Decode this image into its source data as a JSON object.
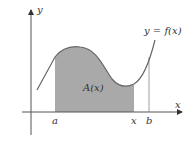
{
  "diagram": {
    "axes": {
      "x_label": "x",
      "y_label": "y"
    },
    "curve_label": "y = f(x)",
    "area_label": "A(x)",
    "ticks": {
      "a": "a",
      "x": "x",
      "b": "b"
    },
    "colors": {
      "area": "#a9a9a9",
      "curve": "#666666",
      "axis": "#555555"
    }
  }
}
